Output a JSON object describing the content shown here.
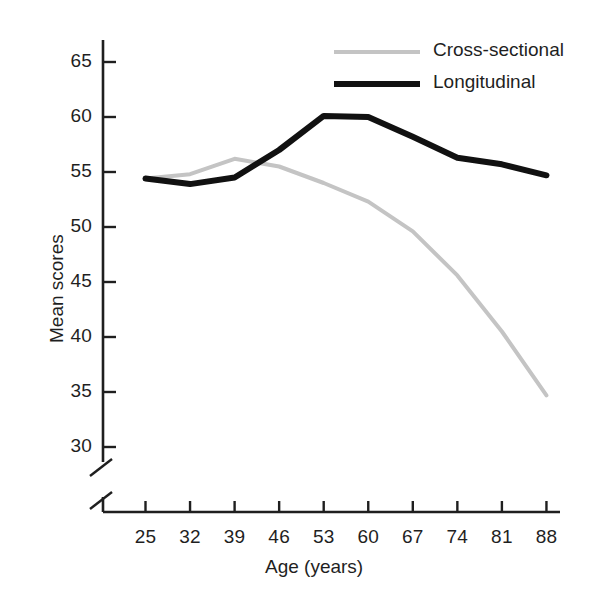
{
  "chart_data": {
    "type": "line",
    "title": "",
    "xlabel": "Age (years)",
    "ylabel": "Mean scores",
    "categories": [
      25,
      32,
      39,
      46,
      53,
      60,
      67,
      74,
      81,
      88
    ],
    "xtick_labels": [
      "25",
      "32",
      "39",
      "46",
      "53",
      "60",
      "67",
      "74",
      "81",
      "88"
    ],
    "ytick_labels": [
      "30",
      "35",
      "40",
      "45",
      "50",
      "55",
      "60",
      "65"
    ],
    "ytick_values": [
      30,
      35,
      40,
      45,
      50,
      55,
      60,
      65
    ],
    "ylim": [
      30,
      65
    ],
    "y_axis_break": true,
    "grid": false,
    "legend_position": "top-right",
    "series": [
      {
        "name": "Cross-sectional",
        "color": "#c4c4c4",
        "width": 4,
        "values": [
          54.4,
          54.8,
          56.2,
          55.5,
          54.0,
          52.3,
          49.6,
          45.6,
          40.5,
          34.7
        ]
      },
      {
        "name": "Longitudinal",
        "color": "#111111",
        "width": 6,
        "values": [
          54.4,
          53.9,
          54.5,
          57.0,
          60.1,
          60.0,
          58.2,
          56.3,
          55.7,
          54.7
        ]
      }
    ]
  },
  "legend": {
    "items": [
      {
        "label": "Cross-sectional"
      },
      {
        "label": "Longitudinal"
      }
    ]
  },
  "axes": {
    "x_title": "Age (years)",
    "y_title": "Mean scores"
  },
  "colors": {
    "cross_sectional": "#c4c4c4",
    "longitudinal": "#111111",
    "axis": "#1f1f1f",
    "background": "#ffffff"
  }
}
